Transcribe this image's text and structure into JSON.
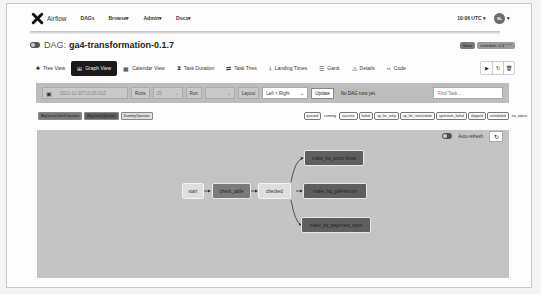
{
  "navbar": {
    "brand": "Airflow",
    "items": [
      {
        "label": "DAGs"
      },
      {
        "label": "Browse",
        "caret": "▾"
      },
      {
        "label": "Admin",
        "caret": "▾"
      },
      {
        "label": "Docs",
        "caret": "▾"
      }
    ],
    "time": "10:06 UTC",
    "time_caret": "▾",
    "avatar": "SL",
    "avatar_caret": "▾"
  },
  "dag": {
    "prefix": "DAG:",
    "name": "ga4-transformation-0.1.7",
    "badges": [
      {
        "label": "None"
      },
      {
        "label": "schedule: 0 4 * * *"
      }
    ]
  },
  "tabs": [
    {
      "label": "Tree View",
      "icon": "tree-icon",
      "active": false
    },
    {
      "label": "Graph View",
      "icon": "graph-icon",
      "active": true
    },
    {
      "label": "Calendar View",
      "icon": "calendar-icon",
      "active": false
    },
    {
      "label": "Task Duration",
      "icon": "hourglass-icon",
      "active": false
    },
    {
      "label": "Task Tries",
      "icon": "tries-icon",
      "active": false
    },
    {
      "label": "Landing Times",
      "icon": "landing-icon",
      "active": false
    },
    {
      "label": "Gantt",
      "icon": "gantt-icon",
      "active": false
    },
    {
      "label": "Details",
      "icon": "details-icon",
      "active": false
    },
    {
      "label": "Code",
      "icon": "code-icon",
      "active": false
    }
  ],
  "actions": {
    "trigger": "▶",
    "refresh": "↻",
    "delete": "🗑"
  },
  "filter": {
    "date": "2021-11-30T10:05:00Z",
    "runs_label": "Runs",
    "runs_value": "25",
    "run_label": "Run",
    "run_value": "",
    "layout_label": "Layout",
    "layout_value": "Left > Right",
    "update_label": "Update",
    "status": "No DAG runs yet.",
    "find_placeholder": "Find Task..."
  },
  "operator_legend": [
    {
      "label": "BigQueryCheckOperator",
      "color": "#7b7b7b"
    },
    {
      "label": "BigQueryOperator",
      "color": "#5f5f5f"
    },
    {
      "label": "DummyOperator",
      "color": "#dedede"
    }
  ],
  "state_legend": [
    {
      "label": "queued"
    },
    {
      "label": "running"
    },
    {
      "label": "success"
    },
    {
      "label": "failed"
    },
    {
      "label": "up_for_retry"
    },
    {
      "label": "up_for_reschedule"
    },
    {
      "label": "upstream_failed"
    },
    {
      "label": "skipped"
    },
    {
      "label": "scheduled"
    },
    {
      "label": "no_status"
    }
  ],
  "graph": {
    "auto_refresh": "Auto-refresh",
    "refresh_icon": "↻",
    "nodes": [
      {
        "id": "start",
        "label": "start",
        "type": "dummy"
      },
      {
        "id": "check_table",
        "label": "check_table",
        "type": "bqcheck"
      },
      {
        "id": "checked",
        "label": "checked",
        "type": "dummy"
      },
      {
        "id": "make_bq_acom_flows",
        "label": "make_bq_acom-flows",
        "type": "bq"
      },
      {
        "id": "make_bq_ga4_int_crm",
        "label": "make_bq_ga4-int-crm",
        "type": "bq"
      },
      {
        "id": "make_bq_pageview_apps",
        "label": "make_bq_pageview_apps",
        "type": "bq"
      }
    ]
  }
}
